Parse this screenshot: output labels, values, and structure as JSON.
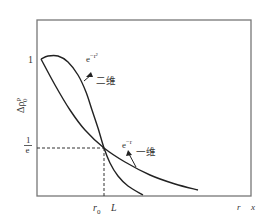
{
  "chart_data": {
    "type": "line",
    "title": "",
    "xlabel": "x",
    "ylabel": "Δρ₀ᵖ",
    "x_tick_labels": [
      "r₀",
      "L",
      "r"
    ],
    "y_tick_labels": [
      "1",
      "1/e"
    ],
    "grid": false,
    "legend": "inline annotations",
    "series": [
      {
        "name": "二维",
        "formula_label": "e^{-r²}",
        "formula_base": "e",
        "formula_exp": "−r²",
        "description": "starts flat at 1, drops steeply, crosses 1/e at r₀, then falls below the 1-D curve",
        "points_px": [
          [
            41,
            59
          ],
          [
            48,
            56
          ],
          [
            58,
            56
          ],
          [
            68,
            62
          ],
          [
            78,
            75
          ],
          [
            86,
            92
          ],
          [
            92,
            110
          ],
          [
            98,
            128
          ],
          [
            104,
            148
          ],
          [
            110,
            163
          ],
          [
            118,
            176
          ],
          [
            128,
            186
          ],
          [
            143,
            195
          ]
        ]
      },
      {
        "name": "一维",
        "formula_label": "e^{-r}",
        "formula_base": "e",
        "formula_exp": "−r",
        "description": "starts at 1, decreases more gradually, passes 1/e at r₀, long tail toward r",
        "points_px": [
          [
            41,
            59
          ],
          [
            55,
            85
          ],
          [
            70,
            110
          ],
          [
            85,
            130
          ],
          [
            104,
            148
          ],
          [
            125,
            162
          ],
          [
            150,
            175
          ],
          [
            175,
            184
          ],
          [
            198,
            190
          ]
        ]
      }
    ],
    "annotations": {
      "y_one": "1",
      "y_inv_e_num": "1",
      "y_inv_e_den": "e",
      "x_r0": "r",
      "x_r0_sub": "0",
      "x_L": "L",
      "x_r": "r",
      "x_axis": "x",
      "two_d_label": "二维",
      "one_d_label": "一维",
      "two_d_formula_base": "e",
      "two_d_formula_exp": "−r²",
      "one_d_formula_base": "e",
      "one_d_formula_exp": "−r",
      "ylabel_main": "Δρ",
      "ylabel_sub": "0",
      "ylabel_sup": "p"
    },
    "axes_px": {
      "left": 37,
      "top": 20,
      "right": 251,
      "bottom": 196
    },
    "crossing_px": {
      "x": 104,
      "y": 148
    }
  },
  "colors": {
    "frame": "#777777",
    "curve": "#222222",
    "dashed": "#333333",
    "text": "#333333"
  }
}
